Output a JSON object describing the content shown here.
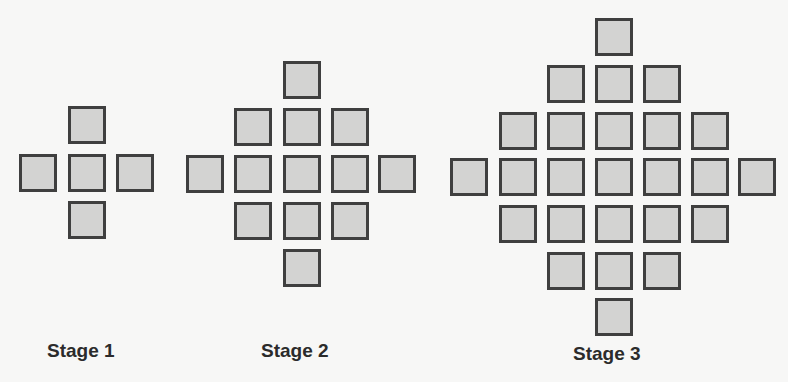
{
  "diagram": {
    "type": "pattern-sequence",
    "colors": {
      "square_fill": "#d3d3d2",
      "square_border": "#3f3f3f",
      "background": "#f7f7f6"
    },
    "stages": [
      {
        "label": "Stage 1",
        "label_pos": [
          47,
          340
        ],
        "square_count": 5,
        "squares": [
          [
            68,
            106
          ],
          [
            19,
            154
          ],
          [
            68,
            154
          ],
          [
            116,
            154
          ],
          [
            68,
            201
          ]
        ]
      },
      {
        "label": "Stage 2",
        "label_pos": [
          261,
          340
        ],
        "square_count": 13,
        "squares": [
          [
            283,
            61
          ],
          [
            234,
            108
          ],
          [
            283,
            108
          ],
          [
            331,
            108
          ],
          [
            186,
            155
          ],
          [
            234,
            155
          ],
          [
            283,
            155
          ],
          [
            331,
            155
          ],
          [
            378,
            155
          ],
          [
            234,
            202
          ],
          [
            283,
            202
          ],
          [
            331,
            202
          ],
          [
            283,
            249
          ]
        ]
      },
      {
        "label": "Stage 3",
        "label_pos": [
          573,
          343
        ],
        "square_count": 25,
        "squares": [
          [
            595,
            18
          ],
          [
            547,
            65
          ],
          [
            595,
            65
          ],
          [
            643,
            65
          ],
          [
            499,
            112
          ],
          [
            547,
            112
          ],
          [
            595,
            112
          ],
          [
            643,
            112
          ],
          [
            691,
            112
          ],
          [
            450,
            158
          ],
          [
            499,
            158
          ],
          [
            547,
            158
          ],
          [
            595,
            158
          ],
          [
            643,
            158
          ],
          [
            691,
            158
          ],
          [
            738,
            158
          ],
          [
            499,
            205
          ],
          [
            547,
            205
          ],
          [
            595,
            205
          ],
          [
            643,
            205
          ],
          [
            691,
            205
          ],
          [
            547,
            252
          ],
          [
            595,
            252
          ],
          [
            643,
            252
          ],
          [
            595,
            298
          ]
        ]
      }
    ]
  }
}
